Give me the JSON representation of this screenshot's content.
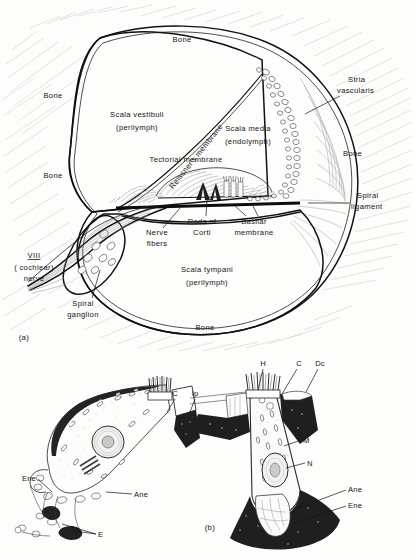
{
  "figure": {
    "background_color": "#fdfdfc",
    "ink_color": "#141414",
    "panels": [
      {
        "id": "a",
        "caption": "(a)",
        "description": "Cross section of one turn of the cochlea"
      },
      {
        "id": "b",
        "caption": "(b)",
        "description": "Inner and outer hair cell ultrastructure"
      }
    ]
  },
  "panel_a": {
    "caption": "(a)",
    "labels": {
      "bone_top": "Bone",
      "bone_left_upper": "Bone",
      "bone_left_lower": "Bone",
      "bone_right": "Bone",
      "bone_bottom": "Bone",
      "scala_vestibuli_l1": "Scala vestibuli",
      "scala_vestibuli_l2": "(perilymph)",
      "scala_media_l1": "Scala media",
      "scala_media_l2": "(endolymph)",
      "scala_tympani_l1": "Scala tympani",
      "scala_tympani_l2": "(perilymph)",
      "reissners_membrane": "Reissner's membrane",
      "tectorial_membrane": "Tectorial membrane",
      "stria_vascularis_l1": "Stria",
      "stria_vascularis_l2": "vascularis",
      "spiral_ligament_l1": "Spiral",
      "spiral_ligament_l2": "ligament",
      "nerve_fibers_l1": "Nerve",
      "nerve_fibers_l2": "fibers",
      "rods_of_corti_l1": "Rods of",
      "rods_of_corti_l2": "Corti",
      "basilar_membrane_l1": "Basilar",
      "basilar_membrane_l2": "membrane",
      "spiral_ganglion_l1": "Spiral",
      "spiral_ganglion_l2": "ganglion",
      "nerve_viii_numeral": "VIII",
      "nerve_viii_l1": "( cochlear)",
      "nerve_viii_l2": "nerve"
    }
  },
  "panel_b": {
    "caption": "(b)",
    "left_cell": {
      "name": "outer-hair-cell",
      "labels": {
        "cuticular_plate": "C",
        "inner_phalangeal": "Ip",
        "efferent_nerve_ending": "Ene",
        "afferent_nerve_ending": "Ane",
        "efferent": "E"
      }
    },
    "right_cell": {
      "name": "inner-hair-cell",
      "labels": {
        "hairs": "H",
        "cuticular_plate": "C",
        "deiters_cell": "Dc",
        "mitochondria": "M",
        "nucleus": "N",
        "afferent_nerve_ending": "Ane",
        "efferent_nerve_ending": "Ene"
      }
    }
  }
}
